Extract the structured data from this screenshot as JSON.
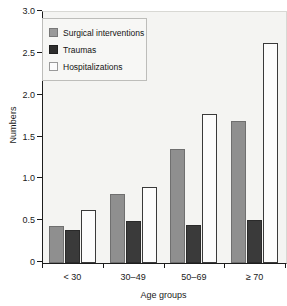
{
  "chart_data": {
    "type": "bar",
    "title": "",
    "xlabel": "Age groups",
    "ylabel": "Numbers",
    "categories": [
      "< 30",
      "30–49",
      "50–69",
      "≥ 70"
    ],
    "series": [
      {
        "name": "Surgical interventions",
        "color": "#8f8f8f",
        "values": [
          0.44,
          0.82,
          1.36,
          1.7
        ]
      },
      {
        "name": "Traumas",
        "color": "#3a3a3a",
        "values": [
          0.39,
          0.5,
          0.45,
          0.52
        ]
      },
      {
        "name": "Hospitalizations",
        "color": "#fcfcfc",
        "values": [
          0.63,
          0.91,
          1.78,
          2.63
        ]
      }
    ],
    "ylim": [
      0,
      3.0
    ],
    "yticks": [
      "0",
      "0.5",
      "1.0",
      "1.5",
      "2.0",
      "2.5",
      "3.0"
    ],
    "ytick_values": [
      0,
      0.5,
      1.0,
      1.5,
      2.0,
      2.5,
      3.0
    ],
    "grid": false,
    "legend_position": "upper left",
    "legend_entries": [
      "Surgical interventions",
      "Traumas",
      "Hospitalizations"
    ]
  },
  "colors": {
    "surgical": "#8f8f8f",
    "trauma": "#3a3a3a",
    "hospitalizations": "#fcfcfc",
    "axis": "#1a1a1a",
    "plot_background": "#f4f4f2"
  }
}
